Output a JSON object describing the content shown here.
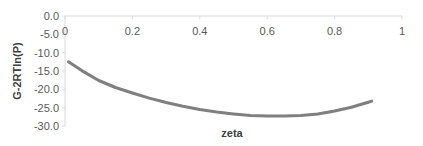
{
  "chart_data": {
    "type": "line",
    "title": "",
    "xlabel": "zeta",
    "ylabel": "G-2RTln(P)",
    "xlim": [
      0,
      1
    ],
    "ylim": [
      -30,
      0
    ],
    "x_ticks": [
      "0",
      "0.2",
      "0.4",
      "0.6",
      "0.8",
      "1"
    ],
    "y_ticks": [
      "0.0",
      "-5.0",
      "-10.0",
      "-15.0",
      "-20.0",
      "-25.0",
      "-30.0"
    ],
    "x_axis_position": "top",
    "grid": false,
    "legend": "none",
    "series": [
      {
        "name": "G-2RTln(P)",
        "color": "#7f7f7f",
        "x": [
          0.01,
          0.05,
          0.1,
          0.15,
          0.2,
          0.25,
          0.3,
          0.35,
          0.4,
          0.45,
          0.5,
          0.55,
          0.6,
          0.65,
          0.7,
          0.75,
          0.8,
          0.85,
          0.9,
          0.91
        ],
        "y": [
          -12.5,
          -14.9,
          -17.6,
          -19.5,
          -21.0,
          -22.4,
          -23.6,
          -24.6,
          -25.5,
          -26.2,
          -26.7,
          -27.1,
          -27.3,
          -27.3,
          -27.1,
          -26.7,
          -25.9,
          -24.9,
          -23.5,
          -23.2
        ]
      }
    ]
  }
}
